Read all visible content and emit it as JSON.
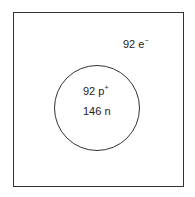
{
  "diagram": {
    "electrons": {
      "count": "92",
      "symbol": "e",
      "charge": "−"
    },
    "nucleus": {
      "protons": {
        "count": "92",
        "symbol": "p",
        "charge": "+"
      },
      "neutrons": {
        "count": "146",
        "symbol": "n"
      }
    },
    "colors": {
      "stroke": "#333333",
      "text": "#222222",
      "background": "#ffffff"
    }
  }
}
